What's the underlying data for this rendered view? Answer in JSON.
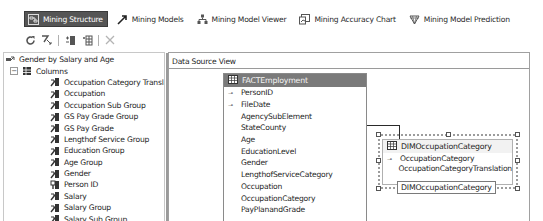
{
  "tabs": [
    {
      "label": "Mining Structure",
      "icon": "mining-structure-icon",
      "active": true
    },
    {
      "label": "Mining Models",
      "icon": "mining-models-icon",
      "active": false
    },
    {
      "label": "Mining Model Viewer",
      "icon": "mining-model-viewer-icon",
      "active": false
    },
    {
      "label": "Mining Accuracy Chart",
      "icon": "mining-accuracy-chart-icon",
      "active": false
    },
    {
      "label": "Mining Model Prediction",
      "icon": "mining-model-prediction-icon",
      "active": false
    }
  ],
  "toolbar": {
    "buttons": [
      "refresh-icon",
      "process-icon",
      "add-column-icon",
      "add-nested-table-icon",
      "delete-icon"
    ]
  },
  "tree": {
    "root": "Gender by Salary and Age",
    "columns_label": "Columns",
    "columns_expander": "−",
    "items": [
      {
        "label": "Occupation Category Translation",
        "key": false
      },
      {
        "label": "Occupation",
        "key": false
      },
      {
        "label": "Occupation Sub Group",
        "key": false
      },
      {
        "label": "GS Pay Grade Group",
        "key": false
      },
      {
        "label": "GS Pay Grade",
        "key": false
      },
      {
        "label": "Lengthof Service Group",
        "key": false
      },
      {
        "label": "Education Group",
        "key": false
      },
      {
        "label": "Age Group",
        "key": false
      },
      {
        "label": "Gender",
        "key": false
      },
      {
        "label": "Person ID",
        "key": true
      },
      {
        "label": "Salary",
        "key": false
      },
      {
        "label": "Salary Group",
        "key": false
      },
      {
        "label": "Salary Sub Group",
        "key": false
      }
    ]
  },
  "dsv": {
    "header": "Data Source View",
    "fact_table": {
      "name": "FACTEmployment",
      "columns": [
        {
          "name": "PersonID",
          "key": true
        },
        {
          "name": "FileDate",
          "key": true
        },
        {
          "name": "AgencySubElement",
          "key": false
        },
        {
          "name": "StateCounty",
          "key": false
        },
        {
          "name": "Age",
          "key": false
        },
        {
          "name": "EducationLevel",
          "key": false
        },
        {
          "name": "Gender",
          "key": false
        },
        {
          "name": "LengthofServiceCategory",
          "key": false
        },
        {
          "name": "Occupation",
          "key": false
        },
        {
          "name": "OccupationCategory",
          "key": false
        },
        {
          "name": "PayPlanandGrade",
          "key": false
        }
      ]
    },
    "dim_table": {
      "name": "DIMOccupationCategory",
      "columns": [
        {
          "name": "OccupationCategory",
          "key": true
        },
        {
          "name": "OccupationCategoryTranslation",
          "key": false
        }
      ],
      "tooltip": "DIMOccupationCategory"
    },
    "key_glyph": "⊸"
  },
  "colors": {
    "active_tab_bg": "#555555",
    "fact_header_bg": "#7a7a7a",
    "selection_frame": "#9c9c9c"
  }
}
